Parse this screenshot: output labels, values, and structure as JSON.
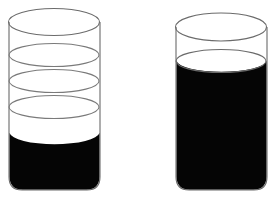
{
  "scene": {
    "title": "Two beakers containing black liquid",
    "background_color": "#ffffff",
    "width": 280,
    "height": 207
  },
  "palette": {
    "liquid_color": "#050505",
    "glass_outline_color": "#6b6b6b",
    "graduation_color": "#7a7a7a",
    "background_color": "#ffffff"
  },
  "beakers": [
    {
      "id": "left",
      "label": "Left beaker",
      "fill_level_percent": 38,
      "fill_state": "partially filled",
      "graduation_marks": 3,
      "geometry": {
        "center_x": 54,
        "left_x": 9,
        "right_x": 100,
        "rim_center_y": 22,
        "rim_radius_x": 45.5,
        "rim_radius_y": 13.5,
        "body_bottom_y": 190,
        "bottom_corner_radius": 13,
        "liquid_surface_center_y": 133,
        "liquid_surface_radius_y": 12
      },
      "graduations": [
        {
          "index": 1,
          "center_y": 55,
          "radius_y": 11.5
        },
        {
          "index": 2,
          "center_y": 81,
          "radius_y": 11.5
        },
        {
          "index": 3,
          "center_y": 107,
          "radius_y": 11.5
        }
      ]
    },
    {
      "id": "right",
      "label": "Right beaker",
      "fill_level_percent": 84,
      "fill_state": "nearly full",
      "graduation_marks": 0,
      "geometry": {
        "center_x": 221,
        "left_x": 176,
        "right_x": 267,
        "rim_center_y": 27,
        "rim_radius_x": 45.5,
        "rim_radius_y": 14,
        "body_bottom_y": 190,
        "bottom_corner_radius": 13,
        "liquid_surface_center_y": 61,
        "liquid_surface_radius_y": 11.5
      },
      "graduations": []
    }
  ]
}
